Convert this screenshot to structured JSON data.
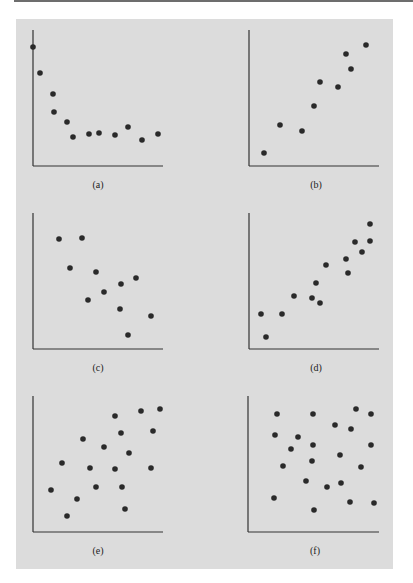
{
  "figure": {
    "background": "#dcdcdc",
    "axis_color": "#333333",
    "dot_color": "#2a2a2a",
    "dot_radius": 2.8
  },
  "chart_data": [
    {
      "type": "scatter",
      "label": "(a)",
      "title": "",
      "xlabel": "",
      "ylabel": "",
      "grid": false,
      "axes": {
        "origin": [
          33,
          166
        ],
        "top": 30,
        "right": 163
      },
      "label_pos": [
        98,
        188
      ],
      "points": [
        [
          33,
          47
        ],
        [
          40,
          73
        ],
        [
          53,
          94
        ],
        [
          54,
          112
        ],
        [
          67,
          122
        ],
        [
          73,
          137
        ],
        [
          89,
          134
        ],
        [
          99,
          133
        ],
        [
          115,
          135
        ],
        [
          128,
          127
        ],
        [
          142,
          140
        ],
        [
          158,
          134
        ]
      ],
      "description": "Nonlinear decreasing relationship leveling off"
    },
    {
      "type": "scatter",
      "label": "(b)",
      "title": "",
      "xlabel": "",
      "ylabel": "",
      "grid": false,
      "axes": {
        "origin": [
          249,
          166
        ],
        "top": 30,
        "right": 379
      },
      "label_pos": [
        316,
        188
      ],
      "points": [
        [
          264,
          153
        ],
        [
          280,
          125
        ],
        [
          302,
          131
        ],
        [
          314,
          106
        ],
        [
          320,
          82
        ],
        [
          338,
          87
        ],
        [
          346,
          54
        ],
        [
          351,
          69
        ],
        [
          366,
          45
        ]
      ],
      "description": "Strong positive linear relationship"
    },
    {
      "type": "scatter",
      "label": "(c)",
      "title": "",
      "xlabel": "",
      "ylabel": "",
      "grid": false,
      "axes": {
        "origin": [
          33,
          349
        ],
        "top": 213,
        "right": 163
      },
      "label_pos": [
        98,
        371
      ],
      "points": [
        [
          59,
          239
        ],
        [
          82,
          238
        ],
        [
          70,
          268
        ],
        [
          96,
          272
        ],
        [
          136,
          278
        ],
        [
          121,
          284
        ],
        [
          104,
          292
        ],
        [
          88,
          300
        ],
        [
          120,
          309
        ],
        [
          151,
          316
        ],
        [
          128,
          335
        ]
      ],
      "description": "Moderate negative linear relationship"
    },
    {
      "type": "scatter",
      "label": "(d)",
      "title": "",
      "xlabel": "",
      "ylabel": "",
      "grid": false,
      "axes": {
        "origin": [
          249,
          349
        ],
        "top": 213,
        "right": 379
      },
      "label_pos": [
        316,
        371
      ],
      "points": [
        [
          370,
          224
        ],
        [
          355,
          242
        ],
        [
          370,
          241
        ],
        [
          362,
          252
        ],
        [
          346,
          259
        ],
        [
          326,
          265
        ],
        [
          348,
          273
        ],
        [
          316,
          283
        ],
        [
          294,
          296
        ],
        [
          312,
          298
        ],
        [
          320,
          303
        ],
        [
          261,
          314
        ],
        [
          282,
          314
        ],
        [
          266,
          337
        ]
      ],
      "description": "Strong positive linear relationship"
    },
    {
      "type": "scatter",
      "label": "(e)",
      "title": "",
      "xlabel": "",
      "ylabel": "",
      "grid": false,
      "axes": {
        "origin": [
          33,
          532
        ],
        "top": 396,
        "right": 163
      },
      "label_pos": [
        98,
        554
      ],
      "points": [
        [
          160,
          409
        ],
        [
          141,
          411
        ],
        [
          115,
          416
        ],
        [
          153,
          431
        ],
        [
          121,
          433
        ],
        [
          83,
          439
        ],
        [
          104,
          447
        ],
        [
          129,
          453
        ],
        [
          62,
          463
        ],
        [
          90,
          468
        ],
        [
          115,
          469
        ],
        [
          151,
          468
        ],
        [
          51,
          490
        ],
        [
          96,
          487
        ],
        [
          122,
          487
        ],
        [
          77,
          499
        ],
        [
          125,
          509
        ],
        [
          67,
          516
        ]
      ],
      "description": "Weak positive linear relationship"
    },
    {
      "type": "scatter",
      "label": "(f)",
      "title": "",
      "xlabel": "",
      "ylabel": "",
      "grid": false,
      "axes": {
        "origin": [
          248,
          532
        ],
        "top": 396,
        "right": 379
      },
      "label_pos": [
        315,
        554
      ],
      "points": [
        [
          277,
          414
        ],
        [
          313,
          414
        ],
        [
          356,
          409
        ],
        [
          371,
          414
        ],
        [
          335,
          425
        ],
        [
          351,
          429
        ],
        [
          275,
          435
        ],
        [
          298,
          437
        ],
        [
          313,
          445
        ],
        [
          371,
          445
        ],
        [
          291,
          449
        ],
        [
          340,
          455
        ],
        [
          312,
          461
        ],
        [
          283,
          466
        ],
        [
          361,
          467
        ],
        [
          306,
          481
        ],
        [
          341,
          483
        ],
        [
          327,
          487
        ],
        [
          274,
          498
        ],
        [
          350,
          502
        ],
        [
          374,
          503
        ],
        [
          314,
          510
        ]
      ],
      "description": "No relationship"
    }
  ]
}
